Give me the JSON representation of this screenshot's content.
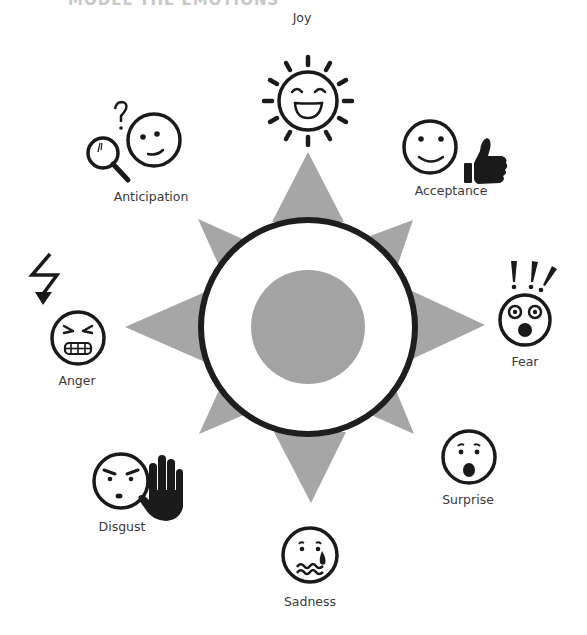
{
  "title_clipped": "MODEL THE EMOTIONS",
  "colors": {
    "spike": "#a6a6a6",
    "core": "#a3a3a3",
    "ring": "#1e1e1e",
    "icon": "#1a1a1a",
    "label": "#3a3a3a"
  },
  "center": {
    "x": 308,
    "y": 327,
    "ring_radius": 107,
    "core_radius": 57
  },
  "emotions": [
    {
      "name": "Joy",
      "icon": "sun-face-icon",
      "label_x": 302,
      "label_y": 12
    },
    {
      "name": "Acceptance",
      "icon": "smile-thumbs-up-icon",
      "label_x": 451,
      "label_y": 185
    },
    {
      "name": "Fear",
      "icon": "shocked-face-exclamation-icon",
      "label_x": 525,
      "label_y": 357
    },
    {
      "name": "Surprise",
      "icon": "surprised-face-icon",
      "label_x": 468,
      "label_y": 495
    },
    {
      "name": "Sadness",
      "icon": "crying-face-icon",
      "label_x": 310,
      "label_y": 596
    },
    {
      "name": "Disgust",
      "icon": "frown-face-stop-hand-icon",
      "label_x": 122,
      "label_y": 521
    },
    {
      "name": "Anger",
      "icon": "angry-face-lightning-icon",
      "label_x": 77,
      "label_y": 375
    },
    {
      "name": "Anticipation",
      "icon": "magnifier-curious-face-icon",
      "label_x": 151,
      "label_y": 191
    }
  ]
}
